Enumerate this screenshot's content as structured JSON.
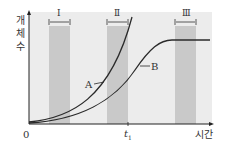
{
  "diagram": {
    "title": "",
    "y_axis_label": [
      "개",
      "체",
      "수"
    ],
    "x_axis_label": "시간",
    "origin_label": "0",
    "time_marker": "t",
    "time_marker_sub": "1",
    "curves": [
      {
        "name": "A",
        "label": "A",
        "shape": "exponential (J-curve)"
      },
      {
        "name": "B",
        "label": "B",
        "shape": "logistic (S-curve)"
      }
    ],
    "intervals": [
      {
        "label": "Ⅰ"
      },
      {
        "label": "Ⅱ"
      },
      {
        "label": "Ⅲ"
      }
    ],
    "colors": {
      "plot_bg": "#ececec",
      "band": "#c9c9c9",
      "curve": "#2a2a2a",
      "axis": "#222222"
    }
  }
}
